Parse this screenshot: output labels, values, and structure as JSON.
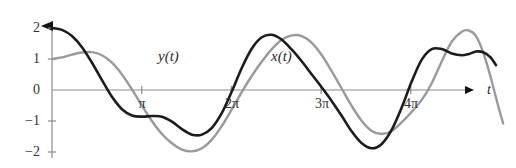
{
  "chart_data": {
    "type": "line",
    "title": "",
    "subtitle": "",
    "xlabel": "t",
    "ylabel": "",
    "xlim": [
      -0.2,
      14.9
    ],
    "ylim": [
      -2.35,
      2.35
    ],
    "grid": false,
    "legend_position": "inline-annotation",
    "axis_style": "arrowed-cross-axes",
    "x_tick_values": [
      3.14159,
      6.28319,
      9.42478,
      12.56637
    ],
    "x_tick_labels": [
      "π",
      "2π",
      "3π",
      "4π"
    ],
    "y_tick_values": [
      2,
      1,
      0,
      -1,
      -2
    ],
    "y_tick_labels": [
      "2",
      "1",
      "0",
      "−1",
      "−2"
    ],
    "annotations": [
      {
        "text": "y(t)",
        "x": 4.05,
        "y": 1.24,
        "series": "y(t)"
      },
      {
        "text": "x(t)",
        "x": 7.95,
        "y": 1.24,
        "series": "x(t)"
      }
    ],
    "series": [
      {
        "name": "y(t)",
        "label": "y(t)",
        "color": "#1c1c1c",
        "linewidth": 2.6,
        "points": [
          [
            0.0,
            2.0
          ],
          [
            0.35,
            1.94
          ],
          [
            0.7,
            1.74
          ],
          [
            1.05,
            1.38
          ],
          [
            1.4,
            0.88
          ],
          [
            1.75,
            0.32
          ],
          [
            2.1,
            -0.22
          ],
          [
            2.45,
            -0.62
          ],
          [
            2.8,
            -0.82
          ],
          [
            3.15,
            -0.86
          ],
          [
            3.5,
            -0.84
          ],
          [
            3.85,
            -0.86
          ],
          [
            4.2,
            -1.02
          ],
          [
            4.55,
            -1.26
          ],
          [
            4.9,
            -1.44
          ],
          [
            5.25,
            -1.44
          ],
          [
            5.6,
            -1.22
          ],
          [
            5.95,
            -0.74
          ],
          [
            6.3,
            -0.04
          ],
          [
            6.65,
            0.72
          ],
          [
            7.0,
            1.34
          ],
          [
            7.35,
            1.7
          ],
          [
            7.7,
            1.78
          ],
          [
            8.05,
            1.62
          ],
          [
            8.4,
            1.3
          ],
          [
            8.75,
            0.92
          ],
          [
            9.1,
            0.5
          ],
          [
            9.45,
            0.08
          ],
          [
            9.8,
            -0.36
          ],
          [
            10.15,
            -0.84
          ],
          [
            10.5,
            -1.34
          ],
          [
            10.85,
            -1.72
          ],
          [
            11.2,
            -1.88
          ],
          [
            11.55,
            -1.74
          ],
          [
            11.9,
            -1.28
          ],
          [
            12.25,
            -0.56
          ],
          [
            12.6,
            0.28
          ],
          [
            12.95,
            0.98
          ],
          [
            13.3,
            1.32
          ],
          [
            13.65,
            1.32
          ],
          [
            14.0,
            1.18
          ],
          [
            14.35,
            1.12
          ],
          [
            14.6,
            1.16
          ],
          [
            14.85,
            1.24
          ],
          [
            15.1,
            1.22
          ],
          [
            15.35,
            1.06
          ],
          [
            15.55,
            0.8
          ]
        ]
      },
      {
        "name": "x(t)",
        "label": "x(t)",
        "color": "#9a9a9a",
        "linewidth": 2.4,
        "points": [
          [
            0.0,
            1.0
          ],
          [
            0.35,
            1.05
          ],
          [
            0.7,
            1.14
          ],
          [
            1.05,
            1.21
          ],
          [
            1.4,
            1.22
          ],
          [
            1.75,
            1.12
          ],
          [
            2.1,
            0.88
          ],
          [
            2.45,
            0.5
          ],
          [
            2.8,
            0.02
          ],
          [
            3.15,
            -0.5
          ],
          [
            3.5,
            -1.0
          ],
          [
            3.85,
            -1.42
          ],
          [
            4.2,
            -1.72
          ],
          [
            4.55,
            -1.92
          ],
          [
            4.9,
            -1.98
          ],
          [
            5.25,
            -1.88
          ],
          [
            5.6,
            -1.6
          ],
          [
            5.95,
            -1.16
          ],
          [
            6.3,
            -0.62
          ],
          [
            6.65,
            -0.06
          ],
          [
            7.0,
            0.46
          ],
          [
            7.35,
            0.92
          ],
          [
            7.7,
            1.32
          ],
          [
            8.05,
            1.62
          ],
          [
            8.4,
            1.76
          ],
          [
            8.75,
            1.74
          ],
          [
            9.1,
            1.52
          ],
          [
            9.45,
            1.12
          ],
          [
            9.8,
            0.6
          ],
          [
            10.15,
            0.04
          ],
          [
            10.5,
            -0.52
          ],
          [
            10.85,
            -1.0
          ],
          [
            11.2,
            -1.32
          ],
          [
            11.55,
            -1.42
          ],
          [
            11.9,
            -1.32
          ],
          [
            12.25,
            -1.04
          ],
          [
            12.6,
            -0.7
          ],
          [
            12.95,
            -0.32
          ],
          [
            13.3,
            0.22
          ],
          [
            13.65,
            0.92
          ],
          [
            14.0,
            1.56
          ],
          [
            14.35,
            1.88
          ],
          [
            14.6,
            1.92
          ],
          [
            14.85,
            1.74
          ],
          [
            15.1,
            1.22
          ],
          [
            15.35,
            0.46
          ],
          [
            15.6,
            -0.42
          ],
          [
            15.8,
            -1.08
          ]
        ]
      }
    ]
  },
  "axes": {
    "origin_label": "0",
    "x_axis_arrow": "arrow-right",
    "y_axis_arrow": "arrow-up",
    "x_axis_name": "t"
  },
  "colors": {
    "dark_curve": "#1c1c1c",
    "light_curve": "#9a9a9a",
    "axis": "#8c8c8c",
    "text": "#333333",
    "background": "#ffffff"
  }
}
